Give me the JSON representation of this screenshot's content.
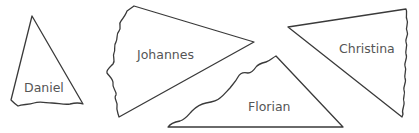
{
  "diagram": {
    "type": "torn-paper-triangles",
    "colors": {
      "stroke": "#3a3a3a",
      "text": "#555555",
      "background": "#ffffff"
    },
    "pieces": [
      {
        "id": "daniel",
        "label": "Daniel"
      },
      {
        "id": "johannes",
        "label": "Johannes"
      },
      {
        "id": "florian",
        "label": "Florian"
      },
      {
        "id": "christina",
        "label": "Christina"
      }
    ]
  }
}
